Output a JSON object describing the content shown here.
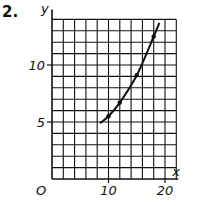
{
  "problem": {
    "number": "2."
  },
  "chart_data": {
    "type": "line",
    "title": "",
    "xlabel": "x",
    "ylabel": "y",
    "origin_label": "O",
    "xlim": [
      0,
      22
    ],
    "ylim": [
      0,
      14
    ],
    "x_ticks": [
      {
        "value": 10,
        "label": "10"
      },
      {
        "value": 20,
        "label": "20"
      }
    ],
    "y_ticks": [
      {
        "value": 5,
        "label": "5"
      },
      {
        "value": 10,
        "label": "10"
      }
    ],
    "grid": true,
    "grid_step_x": 2,
    "grid_step_y": 1,
    "series": [
      {
        "name": "curve",
        "x": [
          8.5,
          10,
          12,
          15,
          18,
          19
        ],
        "y": [
          4.9,
          5.5,
          6.7,
          9.1,
          12.5,
          13.7
        ],
        "markers": [
          {
            "x": 10,
            "y": 5.5
          },
          {
            "x": 12,
            "y": 6.7
          },
          {
            "x": 15,
            "y": 9.1
          },
          {
            "x": 18,
            "y": 12.5
          }
        ]
      }
    ]
  },
  "colors": {
    "ink": "#111111",
    "background": "#ffffff"
  }
}
